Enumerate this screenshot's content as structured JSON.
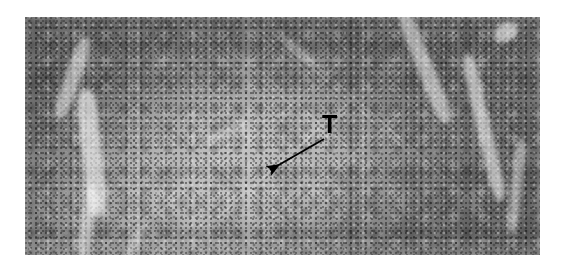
{
  "figure": {
    "type": "histopathology micrograph",
    "staining": "grayscale H&E photomicrograph",
    "background_color": "#ffffff"
  },
  "image_plate": {
    "left": 25,
    "top": 17,
    "width": 515,
    "height": 238,
    "description": "Dense lymphoid tissue with dark cellular periphery, a paler central nodular region, and bright fibrous trabecular bands",
    "tone_dark": "#6e6e6e",
    "tone_mid": "#8a8a8a",
    "tone_light": "#cfcfcf"
  },
  "annotations": {
    "label": {
      "text": "T",
      "color": "#000000",
      "x": 322,
      "y": 112,
      "font_size_px": 25,
      "meaning": "tumor"
    },
    "arrow": {
      "color": "#000000",
      "tail_x": 324,
      "tail_y": 139,
      "tip_x": 265,
      "tip_y": 173,
      "stroke_width": 2,
      "head": "solid-filled-triangle",
      "points_to": "paler central tumor region"
    }
  }
}
